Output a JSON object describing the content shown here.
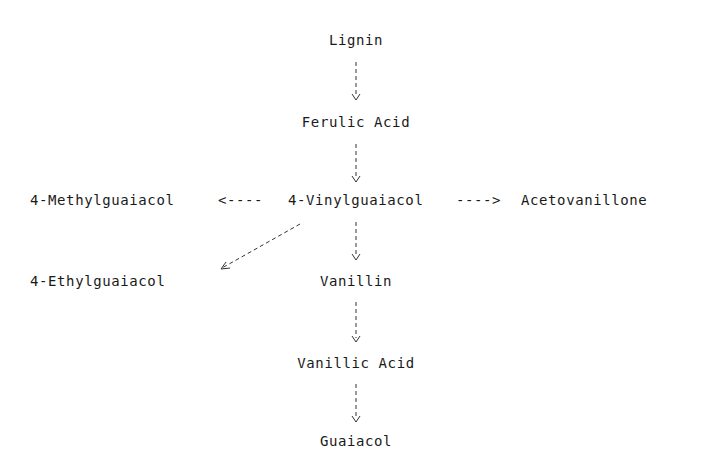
{
  "diagram": {
    "type": "pathway",
    "nodes": [
      {
        "id": "lignin",
        "label": "Lignin"
      },
      {
        "id": "ferulic_acid",
        "label": "Ferulic Acid"
      },
      {
        "id": "methylguaiacol",
        "label": "4-Methylguaiacol"
      },
      {
        "id": "vinylguaiacol",
        "label": "4-Vinylguaiacol"
      },
      {
        "id": "acetovanillone",
        "label": "Acetovanillone"
      },
      {
        "id": "ethylguaiacol",
        "label": "4-Ethylguaiacol"
      },
      {
        "id": "vanillin",
        "label": "Vanillin"
      },
      {
        "id": "vanillic_acid",
        "label": "Vanillic Acid"
      },
      {
        "id": "guaiacol",
        "label": "Guaiacol"
      }
    ],
    "edges": [
      {
        "from": "lignin",
        "to": "ferulic_acid",
        "style": "dashed"
      },
      {
        "from": "ferulic_acid",
        "to": "vinylguaiacol",
        "style": "dashed"
      },
      {
        "from": "vinylguaiacol",
        "to": "methylguaiacol",
        "style": "dashed",
        "glyph": "<----"
      },
      {
        "from": "vinylguaiacol",
        "to": "acetovanillone",
        "style": "dashed",
        "glyph": "---->"
      },
      {
        "from": "vinylguaiacol",
        "to": "ethylguaiacol",
        "style": "dashed"
      },
      {
        "from": "vinylguaiacol",
        "to": "vanillin",
        "style": "dashed"
      },
      {
        "from": "vanillin",
        "to": "vanillic_acid",
        "style": "dashed"
      },
      {
        "from": "vanillic_acid",
        "to": "guaiacol",
        "style": "dashed"
      }
    ],
    "arrow_left": "<----",
    "arrow_right": "---->"
  }
}
